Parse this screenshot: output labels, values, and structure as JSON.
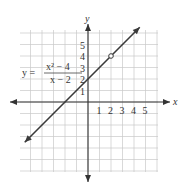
{
  "chart_data": {
    "type": "line",
    "title": "",
    "equation": {
      "lhs": "y =",
      "numerator": "x² − 4",
      "denominator": "x − 2"
    },
    "xlabel": "x",
    "ylabel": "y",
    "x_ticks": [
      "1",
      "2",
      "3",
      "4",
      "5"
    ],
    "y_ticks": [
      "1",
      "2",
      "3",
      "4",
      "5"
    ],
    "xlim": [
      -6,
      6
    ],
    "ylim": [
      -6,
      6
    ],
    "grid": true,
    "series": [
      {
        "name": "y = (x^2 - 4)/(x - 2)",
        "kind": "line",
        "slope": 1,
        "intercept": 2,
        "x": [
          -5.5,
          4.5
        ],
        "y": [
          -3.5,
          6.5
        ],
        "arrows_both_ends": true
      }
    ],
    "annotations": [
      {
        "type": "open-circle",
        "x": 2,
        "y": 4,
        "note": "hole (undefined at x = 2)"
      }
    ]
  },
  "colors": {
    "grid": "#c8c8c8",
    "axis": "#333333",
    "line": "#3a3a3a",
    "text": "#333333"
  }
}
